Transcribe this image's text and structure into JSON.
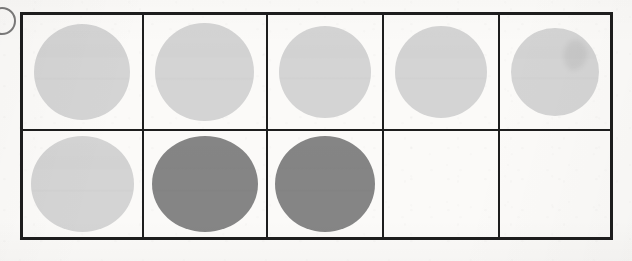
{
  "document": {
    "kind": "scanned-worksheet",
    "page_background": "#fbfaf8",
    "border_color": "#1d1d1d",
    "fill_light": "#d4d4d4",
    "fill_dark": "#858585"
  },
  "marks": {
    "left_edge_mark": {
      "name": "partial-ink-arc",
      "description": "partial dark circular arc clipped by the left page edge"
    }
  },
  "table": {
    "columns": 5,
    "rows": 2,
    "bounds": {
      "x": 20,
      "y": 12,
      "width": 593,
      "height": 228
    },
    "column_widths": [
      120,
      125,
      118,
      117,
      113
    ],
    "row_heights": [
      121,
      107
    ],
    "cells": [
      [
        {
          "id": "r1c1",
          "filled": true,
          "shade": "light",
          "streak": false
        },
        {
          "id": "r1c2",
          "filled": true,
          "shade": "light",
          "streak": false
        },
        {
          "id": "r1c3",
          "filled": true,
          "shade": "light",
          "streak": false
        },
        {
          "id": "r1c4",
          "filled": true,
          "shade": "light",
          "streak": false
        },
        {
          "id": "r1c5",
          "filled": true,
          "shade": "light",
          "streak": true
        }
      ],
      [
        {
          "id": "r2c1",
          "filled": true,
          "shade": "light",
          "streak": false
        },
        {
          "id": "r2c2",
          "filled": true,
          "shade": "dark",
          "streak": false
        },
        {
          "id": "r2c3",
          "filled": true,
          "shade": "dark",
          "streak": false
        },
        {
          "id": "r2c4",
          "filled": false,
          "shade": "none",
          "streak": false
        },
        {
          "id": "r2c5",
          "filled": false,
          "shade": "none",
          "streak": false
        }
      ]
    ]
  }
}
